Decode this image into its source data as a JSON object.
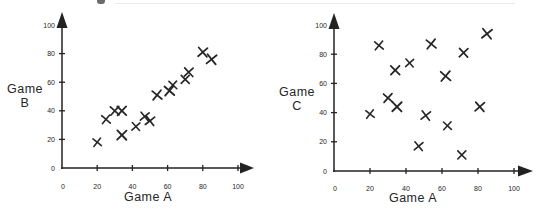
{
  "page": {
    "ink_color": "#222222",
    "marker_color": "#262626",
    "background": "#ffffff"
  },
  "chart_data": [
    {
      "type": "scatter",
      "marker": "x",
      "title": "",
      "xlabel": "Game A",
      "ylabel": "Game B",
      "ylabel_lines": [
        "Game",
        "B"
      ],
      "xlim": [
        0,
        100
      ],
      "ylim": [
        0,
        100
      ],
      "xticks": [
        0,
        20,
        40,
        60,
        80,
        100
      ],
      "yticks": [
        0,
        20,
        40,
        60,
        80,
        100
      ],
      "grid": false,
      "points": [
        [
          20,
          18
        ],
        [
          25,
          34
        ],
        [
          30,
          40
        ],
        [
          34,
          40
        ],
        [
          34,
          23
        ],
        [
          42,
          29
        ],
        [
          47,
          36
        ],
        [
          50,
          33
        ],
        [
          54,
          51
        ],
        [
          61,
          54
        ],
        [
          63,
          58
        ],
        [
          70,
          62
        ],
        [
          72,
          67
        ],
        [
          80,
          81
        ],
        [
          85,
          76
        ]
      ]
    },
    {
      "type": "scatter",
      "marker": "x",
      "title": "",
      "xlabel": "Game A",
      "ylabel": "Game C",
      "ylabel_lines": [
        "Game",
        "C"
      ],
      "xlim": [
        0,
        100
      ],
      "ylim": [
        0,
        100
      ],
      "xticks": [
        0,
        20,
        40,
        60,
        80,
        100
      ],
      "yticks": [
        0,
        20,
        40,
        60,
        80,
        100
      ],
      "grid": false,
      "points": [
        [
          20,
          39
        ],
        [
          25,
          86
        ],
        [
          30,
          50
        ],
        [
          34,
          69
        ],
        [
          35,
          44
        ],
        [
          42,
          74
        ],
        [
          47,
          17
        ],
        [
          51,
          38
        ],
        [
          54,
          87
        ],
        [
          62,
          65
        ],
        [
          63,
          31
        ],
        [
          71,
          11
        ],
        [
          72,
          81
        ],
        [
          81,
          44
        ],
        [
          85,
          94
        ]
      ]
    }
  ]
}
